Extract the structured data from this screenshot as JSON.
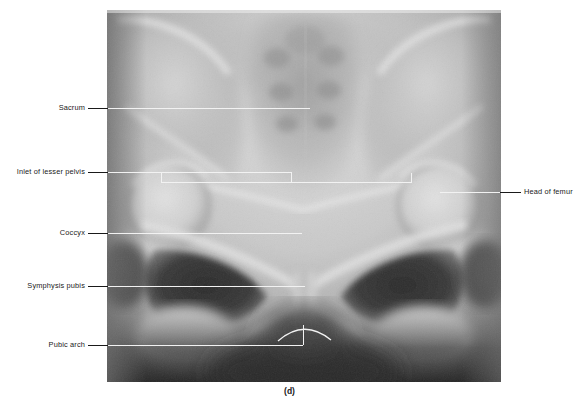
{
  "figure": {
    "caption": "(d)",
    "modality": "radiograph",
    "plate": {
      "left": 107,
      "top": 10,
      "width": 394,
      "height": 372,
      "background_hex": "#8e8e8e"
    }
  },
  "labels": {
    "left": [
      {
        "name": "sacrum",
        "text": "Sacrum",
        "text_x": 52,
        "text_y": 105,
        "dash_x1": 88,
        "dash_x2": 107,
        "dash_y": 108,
        "line_x1": 107,
        "line_x2": 310,
        "line_y": 108
      },
      {
        "name": "inlet-of-lesser-pelvis",
        "text": "Inlet of lesser pelvis",
        "text_x": 8,
        "text_y": 169,
        "dash_x1": 88,
        "dash_x2": 107,
        "dash_y": 172,
        "line_x1": 107,
        "line_x2": 291,
        "line_y": 172
      },
      {
        "name": "coccyx",
        "text": "Coccyx",
        "text_x": 59,
        "text_y": 230,
        "dash_x1": 88,
        "dash_x2": 107,
        "dash_y": 233,
        "line_x1": 107,
        "line_x2": 302,
        "line_y": 233
      },
      {
        "name": "symphysis-pubis",
        "text": "Symphysis pubis",
        "text_x": 17,
        "text_y": 283,
        "dash_x1": 88,
        "dash_x2": 107,
        "dash_y": 286,
        "line_x1": 107,
        "line_x2": 305,
        "line_y": 286
      },
      {
        "name": "pubic-arch",
        "text": "Pubic arch",
        "text_x": 45,
        "text_y": 342,
        "dash_x1": 88,
        "dash_x2": 107,
        "dash_y": 345,
        "line_x1": 107,
        "line_x2": 303,
        "line_y": 345
      }
    ],
    "right": [
      {
        "name": "head-of-femur",
        "text": "Head of femur",
        "text_x": 524,
        "text_y": 189,
        "dash_x1": 500,
        "dash_x2": 521,
        "dash_y": 192,
        "line_x1": 440,
        "line_x2": 500,
        "line_y": 192
      }
    ]
  },
  "annotations": {
    "inlet_bracket": {
      "name": "inlet-of-lesser-pelvis-bracket",
      "y": 182,
      "x1": 161,
      "x2": 411,
      "tick_height": 9,
      "riser_x": 291,
      "riser_top": 172,
      "riser_bottom": 182
    },
    "pubic_arch_arc": {
      "name": "pubic-arch-arc",
      "start_x": 278,
      "start_y": 341,
      "apex_x": 304,
      "apex_y": 323,
      "end_x": 331,
      "end_y": 340,
      "riser_x": 303,
      "riser_top": 325,
      "riser_bottom": 345
    }
  },
  "colors": {
    "leader_dark": "#1a1a1a",
    "leader_light": "#f2f2f2",
    "page_background": "#ffffff"
  }
}
